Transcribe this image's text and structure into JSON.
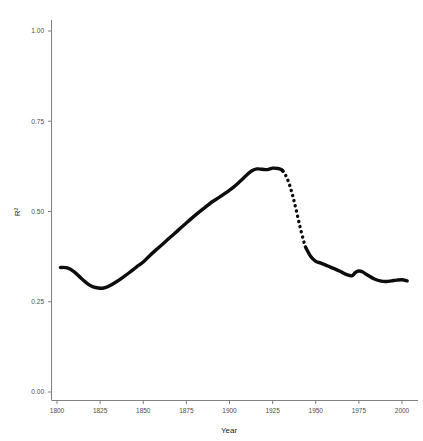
{
  "chart_data": {
    "type": "line",
    "title": "",
    "subtitle": "",
    "xlabel": "Year",
    "ylabel": "R²",
    "xlim": [
      1800,
      2005
    ],
    "ylim": [
      0.0,
      1.0
    ],
    "grid": false,
    "legend": "none",
    "xticks": [
      "1800",
      "1825",
      "1850",
      "1875",
      "1900",
      "1925",
      "1950",
      "1975",
      "2000"
    ],
    "xtick_values": [
      1800,
      1825,
      1850,
      1875,
      1900,
      1925,
      1950,
      1975,
      2000
    ],
    "yticks": [
      "0.00",
      "0.25",
      "0.50",
      "0.75",
      "1.00"
    ],
    "ytick_values": [
      0.0,
      0.25,
      0.5,
      0.75,
      1.0
    ],
    "series": [
      {
        "name": "R-squared over time",
        "style": "solid",
        "color": "#0d0d0d",
        "x": [
          1802,
          1806,
          1810,
          1814,
          1818,
          1821,
          1824,
          1827,
          1830,
          1834,
          1838,
          1842,
          1846,
          1850,
          1854,
          1858,
          1862,
          1866,
          1870,
          1874,
          1878,
          1882,
          1886,
          1890,
          1894,
          1898,
          1902,
          1906,
          1910,
          1913,
          1916,
          1919,
          1922,
          1925,
          1928,
          1930,
          1931
        ],
        "y": [
          0.345,
          0.344,
          0.333,
          0.315,
          0.299,
          0.291,
          0.288,
          0.288,
          0.293,
          0.304,
          0.317,
          0.331,
          0.346,
          0.36,
          0.379,
          0.396,
          0.413,
          0.43,
          0.447,
          0.464,
          0.481,
          0.497,
          0.512,
          0.527,
          0.539,
          0.552,
          0.566,
          0.583,
          0.601,
          0.613,
          0.618,
          0.617,
          0.616,
          0.62,
          0.619,
          0.616,
          0.612
        ]
      },
      {
        "name": "R-squared over time (interpolated)",
        "style": "dotted",
        "color": "#0d0d0d",
        "x": [
          1931,
          1933,
          1935,
          1937,
          1939,
          1941,
          1943,
          1944
        ],
        "y": [
          0.612,
          0.596,
          0.571,
          0.537,
          0.497,
          0.455,
          0.418,
          0.402
        ]
      },
      {
        "name": "R-squared over time (post-war)",
        "style": "solid",
        "color": "#0d0d0d",
        "x": [
          1944,
          1947,
          1950,
          1953,
          1957,
          1961,
          1965,
          1968,
          1971,
          1973,
          1975,
          1977,
          1980,
          1984,
          1988,
          1991,
          1994,
          1997,
          2000,
          2003
        ],
        "y": [
          0.402,
          0.376,
          0.362,
          0.357,
          0.349,
          0.341,
          0.332,
          0.325,
          0.322,
          0.331,
          0.335,
          0.333,
          0.324,
          0.313,
          0.307,
          0.306,
          0.308,
          0.31,
          0.311,
          0.308
        ]
      }
    ]
  },
  "figure": {
    "background_color": "#ffffff",
    "axis_color": "#808080",
    "line_color": "#0d0d0d"
  }
}
